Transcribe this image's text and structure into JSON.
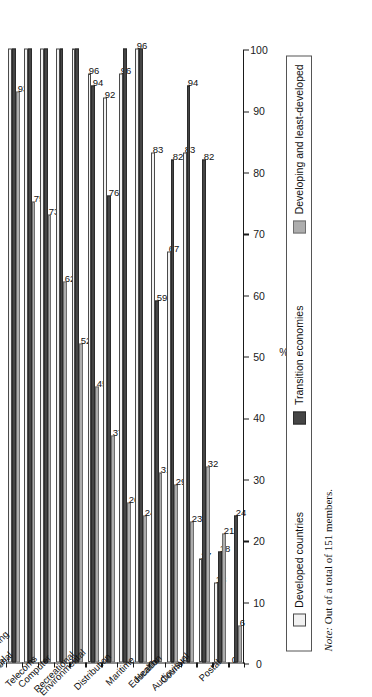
{
  "chart_data": {
    "type": "bar",
    "title": "",
    "subtitle": "",
    "xlabel": "",
    "ylabel": "%",
    "ylim": [
      0,
      100
    ],
    "yticks": [
      100,
      90,
      80,
      70,
      60,
      50,
      40,
      30,
      20,
      10,
      0
    ],
    "grid": false,
    "orientation": "rotated-90",
    "legend_position": "bottom",
    "categories": [
      "Tourism",
      "Financial",
      "Professional",
      "Telecoms",
      "Computer",
      "Construction and engineering",
      "Recreational",
      "Environmental",
      "Distribution",
      "Maritime",
      "Health",
      "Education",
      "Courier",
      "Audiovisual",
      "Postal"
    ],
    "series": [
      {
        "name": "Developed countries",
        "color": "#f2f2f2",
        "values": [
          100,
          100,
          100,
          100,
          100,
          96,
          92,
          96,
          100,
          83,
          67,
          83,
          17,
          13,
          0
        ],
        "labels": [
          "",
          "",
          "",
          "",
          "",
          "96",
          "92",
          "96",
          "96",
          "83",
          "67",
          "83",
          "17",
          "13",
          "0"
        ]
      },
      {
        "name": "Transition economies",
        "color": "#454545",
        "values": [
          100,
          100,
          100,
          100,
          100,
          94,
          76,
          100,
          100,
          59,
          82,
          94,
          82,
          18,
          24
        ],
        "labels": [
          "",
          "",
          "",
          "",
          "",
          "94",
          "76",
          "",
          "",
          "59",
          "82",
          "94",
          "82",
          "18",
          "24"
        ]
      },
      {
        "name": "Developing and least-developed",
        "color": "#adadad",
        "values": [
          93,
          75,
          73,
          62,
          52,
          45,
          37,
          26,
          24,
          31,
          29,
          23,
          32,
          21,
          6
        ],
        "labels": [
          "93",
          "75",
          "73",
          "62",
          "52",
          "45",
          "37",
          "26",
          "24",
          "31",
          "29",
          "23",
          "32",
          "21",
          "6"
        ]
      }
    ],
    "note": "Out of a total of 151 members.",
    "note_prefix": "Note:"
  },
  "legend": {
    "items": [
      {
        "label": "Developed countries",
        "swatch": "dev"
      },
      {
        "label": "Transition economies",
        "swatch": "tra"
      },
      {
        "label": "Developing and least-developed",
        "swatch": "dlc"
      }
    ]
  },
  "axis": {
    "value_axis_label": "%",
    "ticks": [
      "100",
      "90",
      "80",
      "70",
      "60",
      "50",
      "40",
      "30",
      "20",
      "10",
      "0"
    ]
  }
}
